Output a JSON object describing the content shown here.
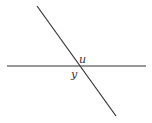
{
  "diagram": {
    "type": "intersecting-lines",
    "lines": [
      {
        "name": "horizontal-line",
        "x1": 7,
        "y1": 66,
        "x2": 146,
        "y2": 66
      },
      {
        "name": "transversal-line",
        "x1": 37,
        "y1": 6,
        "x2": 116,
        "y2": 116
      }
    ],
    "angle_labels": [
      {
        "id": "u",
        "text": "u",
        "x": 79,
        "y": 63
      },
      {
        "id": "y",
        "text": "y",
        "x": 71,
        "y": 78
      }
    ],
    "colors": {
      "stroke": "#333333",
      "background": "#ffffff"
    }
  }
}
